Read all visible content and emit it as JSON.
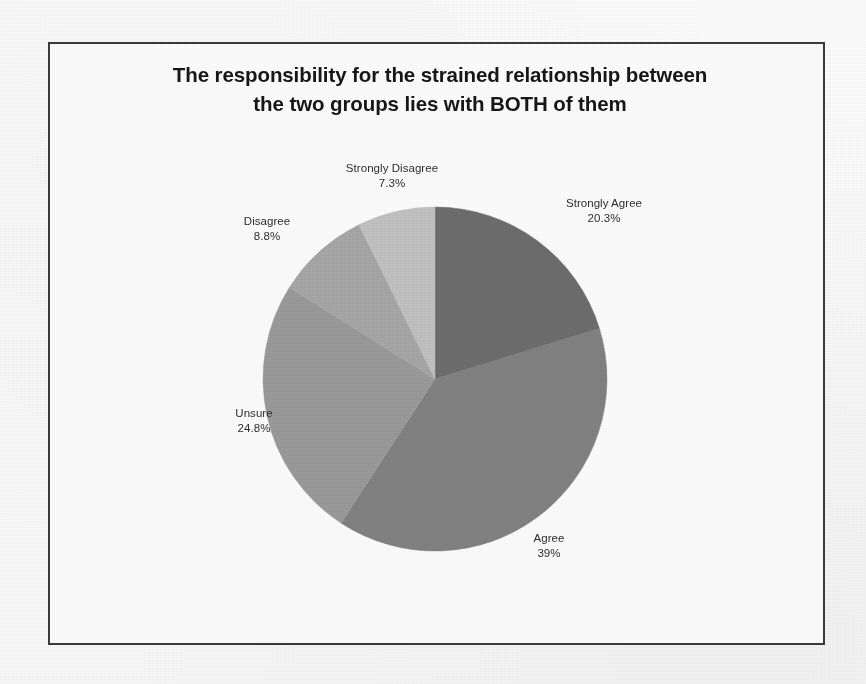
{
  "chart_data": {
    "type": "pie",
    "title": "The responsibility for the strained relationship between the two groups lies with BOTH of them",
    "title_line1": "The responsibility for the strained relationship between",
    "title_line2": "the two groups lies with BOTH of them",
    "categories": [
      "Strongly Agree",
      "Agree",
      "Unsure",
      "Disagree",
      "Strongly Disagree"
    ],
    "values": [
      20.3,
      39,
      24.8,
      8.8,
      7.3
    ],
    "value_labels": [
      "20.3%",
      "39%",
      "24.8%",
      "8.8%",
      "7.3%"
    ],
    "colors": [
      "#6e6e6e",
      "#838383",
      "#9b9b9b",
      "#a8a8a8",
      "#c3c3c3"
    ],
    "start_angle_deg": 0,
    "direction": "clockwise",
    "legend": "none",
    "labels_position": "outside",
    "xlabel": "",
    "ylabel": "",
    "slices": [
      {
        "label": "Strongly Agree",
        "percent_text": "20.3%",
        "value": 20.3,
        "color": "#6e6e6e"
      },
      {
        "label": "Agree",
        "percent_text": "39%",
        "value": 39.0,
        "color": "#838383"
      },
      {
        "label": "Unsure",
        "percent_text": "24.8%",
        "value": 24.8,
        "color": "#9b9b9b"
      },
      {
        "label": "Disagree",
        "percent_text": "8.8%",
        "value": 8.8,
        "color": "#a8a8a8"
      },
      {
        "label": "Strongly Disagree",
        "percent_text": "7.3%",
        "value": 7.3,
        "color": "#c3c3c3"
      }
    ]
  },
  "frame": {
    "border_color": "#3b3b3b",
    "background": "#ffffff"
  }
}
